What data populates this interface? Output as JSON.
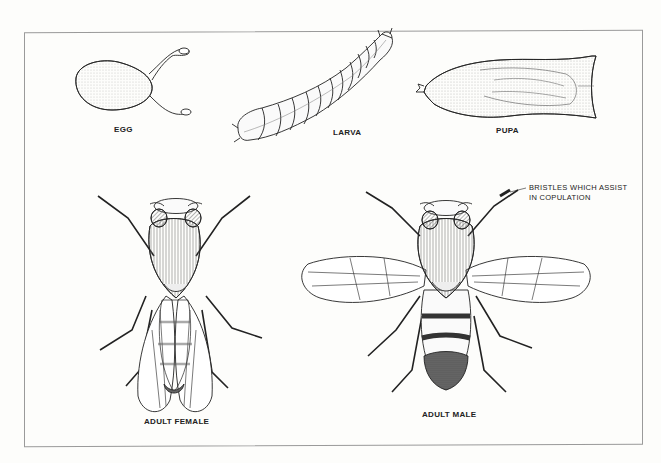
{
  "diagram": {
    "stages": [
      {
        "id": "egg",
        "label": "EGG"
      },
      {
        "id": "larva",
        "label": "LARVA"
      },
      {
        "id": "pupa",
        "label": "PUPA"
      },
      {
        "id": "adult-female",
        "label": "ADULT FEMALE"
      },
      {
        "id": "adult-male",
        "label": "ADULT MALE"
      }
    ],
    "annotations": [
      {
        "id": "sex-comb",
        "line1": "BRISTLES WHICH ASSIST",
        "line2": "IN COPULATION",
        "target": "adult-male foreleg"
      }
    ],
    "colors": {
      "ink": "#222222",
      "paper": "#fdfdfb",
      "frame": "#9a9a9a",
      "shade": "#555555"
    }
  }
}
